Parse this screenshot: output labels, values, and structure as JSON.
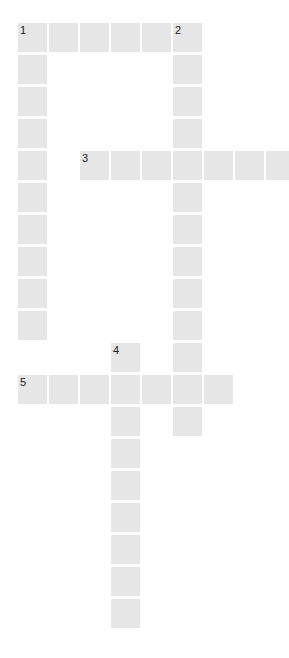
{
  "puzzle": {
    "type": "crossword",
    "cell_color": "#e6e6e6",
    "number_color": "#222222",
    "geometry": {
      "origin_x": 18,
      "origin_y": 23,
      "col_pitch": 31,
      "row_pitch": 32,
      "cell_size": 29
    },
    "entries": [
      {
        "number": "1",
        "direction": "down",
        "row": 0,
        "col": 0,
        "length": 10
      },
      {
        "number": "1",
        "direction": "across",
        "row": 0,
        "col": 0,
        "length": 6
      },
      {
        "number": "2",
        "direction": "down",
        "row": 0,
        "col": 5,
        "length": 13
      },
      {
        "number": "3",
        "direction": "across",
        "row": 4,
        "col": 2,
        "length": 7
      },
      {
        "number": "4",
        "direction": "down",
        "row": 10,
        "col": 3,
        "length": 9
      },
      {
        "number": "5",
        "direction": "across",
        "row": 11,
        "col": 0,
        "length": 7
      }
    ],
    "numbered_cells": [
      {
        "label": "1",
        "row": 0,
        "col": 0
      },
      {
        "label": "2",
        "row": 0,
        "col": 5
      },
      {
        "label": "3",
        "row": 4,
        "col": 2
      },
      {
        "label": "4",
        "row": 10,
        "col": 3
      },
      {
        "label": "5",
        "row": 11,
        "col": 0
      }
    ]
  }
}
